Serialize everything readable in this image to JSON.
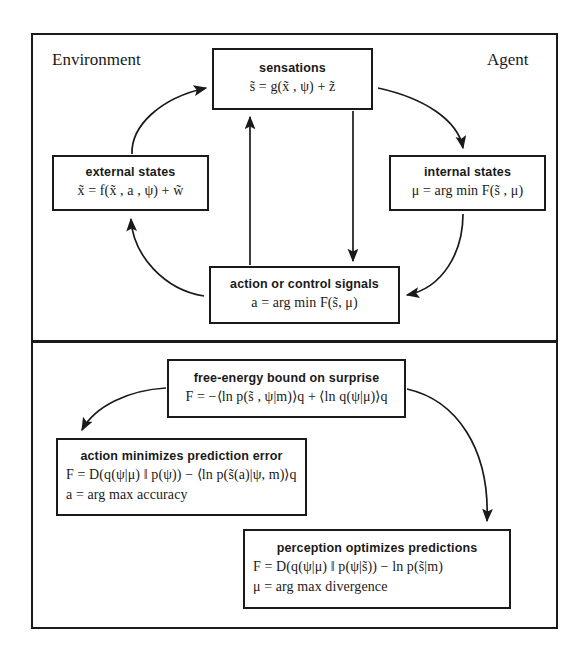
{
  "panels": {
    "top": {
      "name": "environment-agent-loop",
      "left_label": "Environment",
      "right_label": "Agent"
    },
    "bottom": {
      "name": "free-energy-decompositions"
    }
  },
  "nodes": {
    "sensations": {
      "title": "sensations",
      "equation": "s̃ = g(x̃ , ψ) + z̃"
    },
    "external_states": {
      "title": "external states",
      "equation": "x̃ = f(x̃ , a , ψ) + w̃"
    },
    "internal_states": {
      "title": "internal states",
      "equation": "μ = arg min F(s̃ , μ)"
    },
    "action": {
      "title": "action or control signals",
      "equation": "a = arg min F(s̃, μ)"
    },
    "free_energy": {
      "title": "free-energy bound on surprise",
      "equation": "F = −⟨ln p(s̃ , ψ|m)⟩q + ⟨ln q(ψ|μ)⟩q"
    },
    "action_minimizes": {
      "title": "action minimizes prediction error",
      "equation_1": "F = D(q(ψ|μ) ‖ p(ψ)) − ⟨ln p(s̃(a)|ψ, m)⟩q",
      "equation_2": "a = arg max accuracy"
    },
    "perception_optimizes": {
      "title": "perception optimizes predictions",
      "equation_1": "F = D(q(ψ|μ) ‖ p(ψ|s̃)) − ln p(s̃|m)",
      "equation_2": "μ = arg max divergence"
    }
  },
  "arrows": [
    {
      "name": "external-to-sensations",
      "from": "external_states",
      "to": "sensations",
      "style": "curved"
    },
    {
      "name": "sensations-to-internal",
      "from": "sensations",
      "to": "internal_states",
      "style": "curved"
    },
    {
      "name": "internal-to-action",
      "from": "internal_states",
      "to": "action",
      "style": "curved"
    },
    {
      "name": "action-to-external",
      "from": "action",
      "to": "external_states",
      "style": "curved"
    },
    {
      "name": "action-to-sensations",
      "from": "action",
      "to": "sensations",
      "style": "straight"
    },
    {
      "name": "sensations-to-action",
      "from": "sensations",
      "to": "action",
      "style": "straight"
    },
    {
      "name": "freeenergy-to-action-minimizes",
      "from": "free_energy",
      "to": "action_minimizes",
      "style": "curved"
    },
    {
      "name": "freeenergy-to-perception",
      "from": "free_energy",
      "to": "perception_optimizes",
      "style": "curved"
    }
  ],
  "colors": {
    "ink": "#1a1a1a",
    "background": "#ffffff"
  }
}
